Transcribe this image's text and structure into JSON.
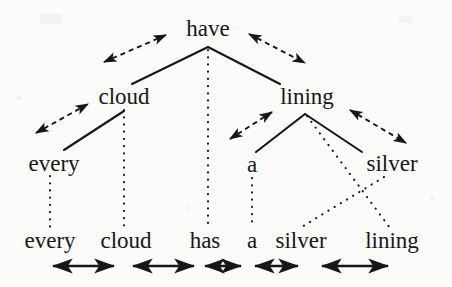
{
  "figure": {
    "type": "dependency-tree-alignment-diagram",
    "background_color": "#fbfbf9",
    "ink_color": "#17161a",
    "sentence": "every cloud has a silver lining"
  },
  "tree": {
    "root_label": "have",
    "nodes": [
      {
        "id": "have",
        "label": "have",
        "x": 208,
        "y": 28,
        "level": 0
      },
      {
        "id": "cloud",
        "label": "cloud",
        "x": 124,
        "y": 96,
        "level": 1
      },
      {
        "id": "lining",
        "label": "lining",
        "x": 307,
        "y": 96,
        "level": 1
      },
      {
        "id": "every",
        "label": "every",
        "x": 54,
        "y": 163,
        "level": 2
      },
      {
        "id": "a",
        "label": "a",
        "x": 252,
        "y": 164,
        "level": 2
      },
      {
        "id": "silver",
        "label": "silver",
        "x": 392,
        "y": 163,
        "level": 2
      }
    ],
    "solid_edges": [
      {
        "from": "have",
        "to": "cloud",
        "x1": 208,
        "y1": 47,
        "x2": 132,
        "y2": 84
      },
      {
        "from": "have",
        "to": "lining",
        "x1": 208,
        "y1": 47,
        "x2": 280,
        "y2": 84
      },
      {
        "from": "cloud",
        "to": "every",
        "x1": 124,
        "y1": 111,
        "x2": 64,
        "y2": 150
      },
      {
        "from": "lining",
        "to": "a",
        "x1": 305,
        "y1": 114,
        "x2": 256,
        "y2": 152
      },
      {
        "from": "lining",
        "to": "silver",
        "x1": 305,
        "y1": 114,
        "x2": 360,
        "y2": 152
      }
    ]
  },
  "surface_row": {
    "words": [
      {
        "label": "every",
        "x": 50,
        "y": 240
      },
      {
        "label": "cloud",
        "x": 126,
        "y": 240
      },
      {
        "label": "has",
        "x": 205,
        "y": 240
      },
      {
        "label": "a",
        "x": 252,
        "y": 240
      },
      {
        "label": "silver",
        "x": 301,
        "y": 240
      },
      {
        "label": "lining",
        "x": 392,
        "y": 240
      }
    ]
  },
  "alignment_links": {
    "style": "dotted",
    "links": [
      {
        "from": "every",
        "to": "every",
        "x1": 50,
        "y1": 176,
        "x2": 50,
        "y2": 228
      },
      {
        "from": "cloud",
        "to": "cloud",
        "x1": 124,
        "y1": 110,
        "x2": 124,
        "y2": 228
      },
      {
        "from": "have",
        "to": "has",
        "x1": 208,
        "y1": 49,
        "x2": 208,
        "y2": 228
      },
      {
        "from": "a",
        "to": "a",
        "x1": 252,
        "y1": 178,
        "x2": 252,
        "y2": 228
      },
      {
        "from": "lining-apex",
        "to": "lining",
        "x1": 307,
        "y1": 115,
        "x2": 390,
        "y2": 228
      },
      {
        "from": "silver",
        "to": "silver",
        "x1": 384,
        "y1": 177,
        "x2": 300,
        "y2": 228
      }
    ]
  },
  "dashed_arrows": {
    "style": "dashed-double-headed",
    "arrows": [
      {
        "id": "have-cloud",
        "x1": 104,
        "y1": 62,
        "x2": 166,
        "y2": 35
      },
      {
        "id": "have-lining",
        "x1": 249,
        "y1": 34,
        "x2": 305,
        "y2": 63
      },
      {
        "id": "cloud-every",
        "x1": 36,
        "y1": 133,
        "x2": 88,
        "y2": 104
      },
      {
        "id": "lining-a",
        "x1": 230,
        "y1": 139,
        "x2": 272,
        "y2": 112
      },
      {
        "id": "lining-silver",
        "x1": 350,
        "y1": 110,
        "x2": 406,
        "y2": 143
      }
    ]
  },
  "span_arrows": {
    "style": "solid-double-headed",
    "y": 266,
    "arrows": [
      {
        "id": "span-every-cloud",
        "x1": 53,
        "x2": 114
      },
      {
        "id": "span-cloud-has",
        "x1": 133,
        "x2": 194
      },
      {
        "id": "span-has-a",
        "x1": 205,
        "x2": 241
      },
      {
        "id": "span-a-silver",
        "x1": 255,
        "x2": 298
      },
      {
        "id": "span-silver-lining",
        "x1": 322,
        "x2": 388
      }
    ]
  }
}
